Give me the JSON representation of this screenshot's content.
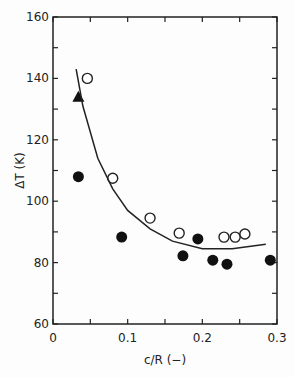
{
  "chart_data": {
    "type": "scatter",
    "title": "",
    "xlabel": "c/R (−)",
    "ylabel": "ΔT (K)",
    "xlim": [
      0,
      0.3
    ],
    "ylim": [
      60,
      160
    ],
    "xticks": [
      "0",
      "0.1",
      "0.2",
      "0.3"
    ],
    "yticks": [
      "60",
      "80",
      "100",
      "120",
      "140",
      "160"
    ],
    "grid": false,
    "series": [
      {
        "name": "open circles",
        "marker": "open-circle",
        "points": [
          [
            0.046,
            140
          ],
          [
            0.08,
            107.5
          ],
          [
            0.13,
            94.5
          ],
          [
            0.169,
            89.6
          ],
          [
            0.229,
            88.3
          ],
          [
            0.244,
            88.3
          ],
          [
            0.257,
            89.3
          ]
        ]
      },
      {
        "name": "filled circles",
        "marker": "filled-circle",
        "points": [
          [
            0.034,
            108
          ],
          [
            0.092,
            88.3
          ],
          [
            0.174,
            82.2
          ],
          [
            0.194,
            87.7
          ],
          [
            0.214,
            80.8
          ],
          [
            0.233,
            79.5
          ],
          [
            0.291,
            80.8
          ]
        ]
      },
      {
        "name": "filled triangle",
        "marker": "filled-triangle",
        "points": [
          [
            0.034,
            134
          ]
        ]
      },
      {
        "name": "fit curve",
        "marker": "line",
        "points": [
          [
            0.031,
            143
          ],
          [
            0.04,
            131
          ],
          [
            0.06,
            114
          ],
          [
            0.08,
            104
          ],
          [
            0.1,
            97
          ],
          [
            0.13,
            91
          ],
          [
            0.16,
            87
          ],
          [
            0.2,
            84.5
          ],
          [
            0.24,
            84.5
          ],
          [
            0.285,
            86
          ]
        ]
      }
    ]
  }
}
